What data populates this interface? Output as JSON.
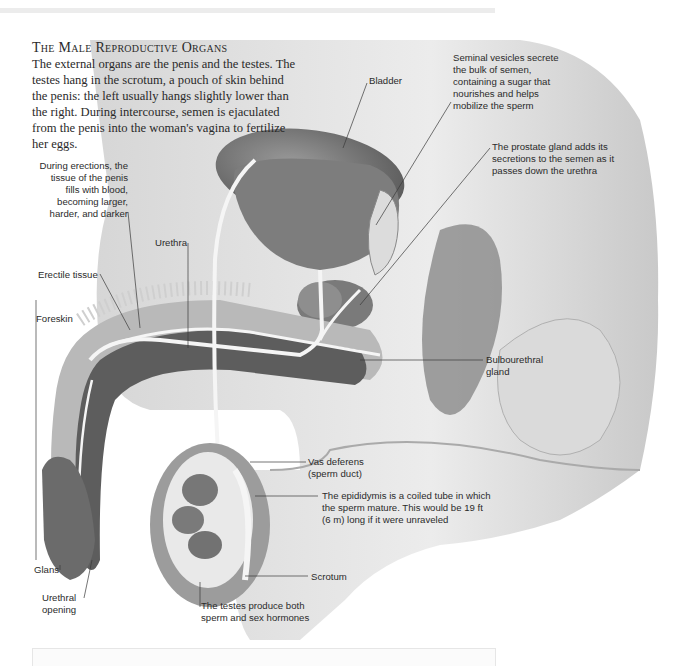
{
  "header": {
    "title": "The Male Reproductive Organs",
    "intro": "The external organs are the penis and the testes. The testes hang in the scrotum, a pouch of skin behind the penis: the left usually hangs slightly lower than the right. During intercourse, semen is ejaculated from the penis into the woman's vagina to fertilize her eggs."
  },
  "labels": {
    "bladder": "Bladder",
    "seminal_vesicles": "Seminal vesicles secrete\nthe bulk of semen,\ncontaining a sugar that\nnourishes and helps\nmobilize the sperm",
    "prostate": "The prostate gland adds its\nsecretions to the semen as it\npasses down the urethra",
    "erections": "During erections, the\ntissue of the penis\nfills with blood,\nbecoming larger,\nharder, and darker",
    "urethra": "Urethra",
    "erectile_tissue": "Erectile tissue",
    "foreskin": "Foreskin",
    "bulbourethral": "Bulbourethral\ngland",
    "vas_deferens": "Vas deferens\n(sperm duct)",
    "epididymis": "The epididymis is a coiled tube in which\nthe sperm mature. This would be 19 ft\n(6 m) long if it were unraveled",
    "scrotum": "Scrotum",
    "glans": "Glans",
    "urethral_opening": "Urethral\nopening",
    "testes": "The testes produce both\nsperm and sex hormones"
  },
  "colors": {
    "skin": "#e4e4e4",
    "organ_dark": "#5a5a5a",
    "organ_mid": "#8c8c8c",
    "duct": "#f7f7f7",
    "text": "#2b2b2b"
  }
}
